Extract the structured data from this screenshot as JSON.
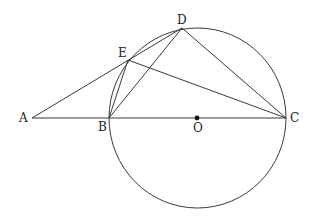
{
  "diagram": {
    "type": "geometry",
    "colors": {
      "stroke": "#3a3a3a",
      "label": "#222222",
      "background": "#ffffff"
    },
    "points": [
      {
        "id": "A",
        "label": "A"
      },
      {
        "id": "B",
        "label": "B"
      },
      {
        "id": "O",
        "label": "O",
        "marked": true
      },
      {
        "id": "C",
        "label": "C"
      },
      {
        "id": "D",
        "label": "D"
      },
      {
        "id": "E",
        "label": "E"
      }
    ],
    "circle": {
      "center": "O",
      "through": [
        "B",
        "C",
        "D",
        "E"
      ]
    },
    "segments": [
      [
        "A",
        "C"
      ],
      [
        "A",
        "D"
      ],
      [
        "B",
        "E"
      ],
      [
        "B",
        "D"
      ],
      [
        "E",
        "C"
      ],
      [
        "D",
        "C"
      ]
    ]
  }
}
